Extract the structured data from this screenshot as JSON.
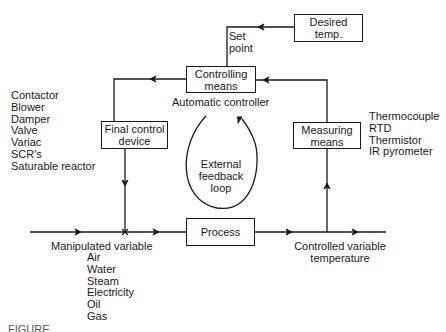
{
  "diagram": {
    "boxes": {
      "desired_temp": "Desired\ntemp.",
      "controlling_means": "Controlling\nmeans",
      "final_control_device": "Final control\ndevice",
      "measuring_means": "Measuring\nmeans",
      "process": "Process"
    },
    "labels": {
      "set_point": "Set\npoint",
      "automatic_controller": "Automatic controller",
      "external_feedback_loop": "External\nfeedback\nloop",
      "manipulated_variable": "Manipulated variable",
      "controlled_variable": "Controlled variable\ntemperature"
    },
    "final_control_examples": [
      "Contactor",
      "Blower",
      "Damper",
      "Valve",
      "Variac",
      "SCR's",
      "Saturable reactor"
    ],
    "measuring_examples": [
      "Thermocouple",
      "RTD",
      "Thermistor",
      "IR pyrometer"
    ],
    "manipulated_examples": [
      "Air",
      "Water",
      "Steam",
      "Electricity",
      "Oil",
      "Gas"
    ],
    "caption_clipped": "FIGURE"
  }
}
